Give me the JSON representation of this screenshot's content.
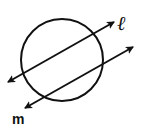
{
  "diagram": {
    "circle": {
      "cx": 62,
      "cy": 60,
      "r": 41
    },
    "lines": [
      {
        "name": "ℓ",
        "x1": 8,
        "y1": 82,
        "x2": 114,
        "y2": 22,
        "arrows": "both"
      },
      {
        "name": "m",
        "x1": 25,
        "y1": 108,
        "x2": 133,
        "y2": 47,
        "arrows": "both"
      }
    ],
    "labels": {
      "line_l": "ℓ",
      "line_m": "m"
    },
    "stroke_color": "#111111"
  }
}
